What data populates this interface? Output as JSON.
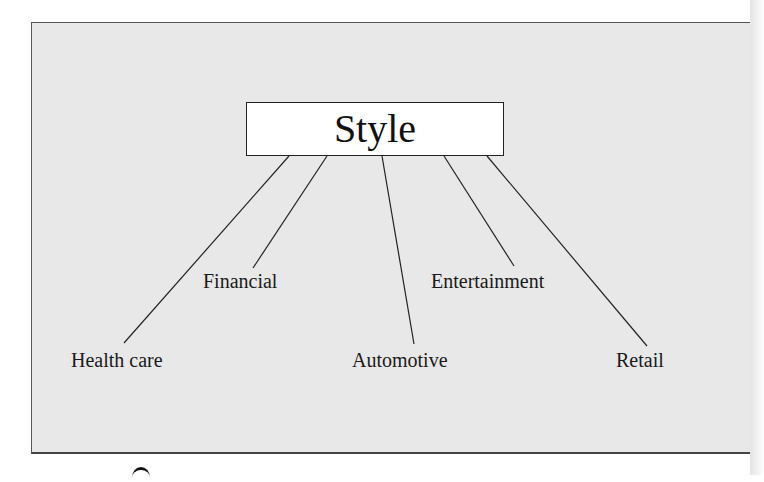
{
  "diagram": {
    "type": "tree",
    "root": {
      "label": "Style"
    },
    "children": [
      {
        "label": "Health care"
      },
      {
        "label": "Financial"
      },
      {
        "label": "Automotive"
      },
      {
        "label": "Entertainment"
      },
      {
        "label": "Retail"
      }
    ]
  },
  "colors": {
    "panel_background": "#e8e8e8",
    "root_box_background": "#ffffff",
    "line_color": "#222222",
    "text_color": "#1a1a1a"
  }
}
